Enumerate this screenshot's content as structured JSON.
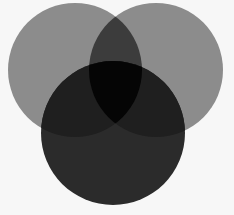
{
  "diagram": {
    "type": "venn",
    "set_count": 3,
    "background": "#f7f7f7",
    "circles": [
      {
        "id": "top-left",
        "cx": 75,
        "cy": 70,
        "r": 67,
        "color": "#8c8c8c"
      },
      {
        "id": "top-right",
        "cx": 156,
        "cy": 70,
        "r": 67,
        "color": "#8c8c8c"
      },
      {
        "id": "bottom",
        "cx": 113,
        "cy": 133,
        "r": 72,
        "color": "#2b2b2b"
      }
    ],
    "regions": {
      "top_overlap": "#3c3c3c",
      "center_triple_overlap": "#050505",
      "bottom_with_side": "#1e1e1e"
    }
  }
}
